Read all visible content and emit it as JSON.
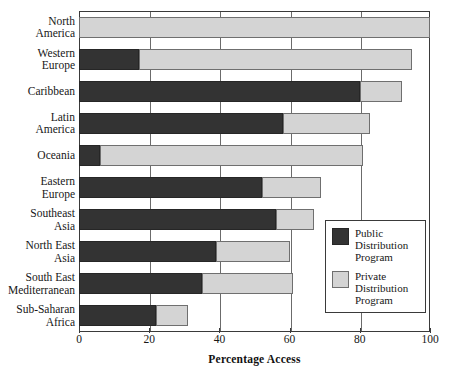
{
  "chart_data": {
    "type": "bar",
    "orientation": "horizontal",
    "stacked": true,
    "title": "",
    "xlabel": "Percentage Access",
    "ylabel": "",
    "xlim": [
      0,
      100
    ],
    "xticks": [
      0,
      20,
      40,
      60,
      80,
      100
    ],
    "grid": true,
    "legend_position": "center-right",
    "categories": [
      "North America",
      "Western Europe",
      "Caribbean",
      "Latin America",
      "Oceania",
      "Eastern Europe",
      "Southeast Asia",
      "North East Asia",
      "South East Mediterranean",
      "Sub-Saharan Africa"
    ],
    "series": [
      {
        "name": "Public Distribution Program",
        "color": "#333333",
        "values": [
          0,
          17,
          80,
          58,
          6,
          52,
          56,
          39,
          35,
          22
        ]
      },
      {
        "name": "Private Distribution Program",
        "color": "#d4d4d4",
        "values": [
          100,
          78,
          12,
          25,
          75,
          17,
          11,
          21,
          26,
          9
        ]
      }
    ],
    "totals": [
      100,
      95,
      92,
      83,
      81,
      69,
      67,
      60,
      61,
      31
    ]
  },
  "axis": {
    "x_title": "Percentage Access",
    "tick_labels": [
      "0",
      "20",
      "40",
      "60",
      "80",
      "100"
    ]
  },
  "category_labels": [
    {
      "line1": "North",
      "line2": "America"
    },
    {
      "line1": "Western",
      "line2": "Europe"
    },
    {
      "line1": "Caribbean",
      "line2": ""
    },
    {
      "line1": "Latin",
      "line2": "America"
    },
    {
      "line1": "Oceania",
      "line2": ""
    },
    {
      "line1": "Eastern",
      "line2": "Europe"
    },
    {
      "line1": "Southeast",
      "line2": "Asia"
    },
    {
      "line1": "North East",
      "line2": "Asia"
    },
    {
      "line1": "South East",
      "line2": "Mediterranean"
    },
    {
      "line1": "Sub-Saharan",
      "line2": "Africa"
    }
  ],
  "legend": {
    "entries": [
      {
        "label_line1": "Public",
        "label_line2": "Distribution",
        "label_line3": "Program",
        "swatch": "public"
      },
      {
        "label_line1": "Private",
        "label_line2": "Distribution",
        "label_line3": "Program",
        "swatch": "private"
      }
    ]
  },
  "colors": {
    "public": "#333333",
    "private": "#d4d4d4",
    "axis": "#3a3a3a",
    "grid": "#6b6b6b",
    "text": "#171717",
    "background": "#ffffff"
  }
}
